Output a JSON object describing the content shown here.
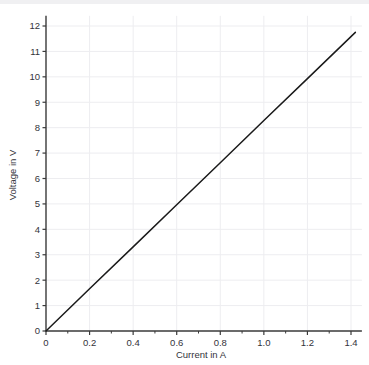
{
  "chart_data": {
    "type": "line",
    "title": "",
    "xlabel": "Current in A",
    "ylabel": "Voltage in V",
    "xlim": [
      0,
      1.45
    ],
    "ylim": [
      0,
      12.4
    ],
    "xticks": [
      0,
      0.2,
      0.4,
      0.6,
      0.8,
      1.0,
      1.2,
      1.4
    ],
    "xticklabels": [
      "0",
      "0.2",
      "0.4",
      "0.6",
      "0.8",
      "1.0",
      "1.2",
      "1.4"
    ],
    "xminor_step": 0.1,
    "yticks": [
      0,
      1,
      2,
      3,
      4,
      5,
      6,
      7,
      8,
      9,
      10,
      11,
      12
    ],
    "yticklabels": [
      "0",
      "1",
      "2",
      "3",
      "4",
      "5",
      "6",
      "7",
      "8",
      "9",
      "10",
      "11",
      "12"
    ],
    "grid": true,
    "legend": "none",
    "series": [
      {
        "name": "Voltage vs Current",
        "color": "#1a1a1a",
        "x": [
          0,
          0.2,
          0.4,
          0.6,
          0.8,
          1.0,
          1.2,
          1.42
        ],
        "y": [
          0,
          1.66,
          3.31,
          4.97,
          6.62,
          8.28,
          9.93,
          11.75
        ]
      }
    ],
    "colors": {
      "line": "#1a1a1a",
      "axis": "#3a3a3a",
      "grid": "#ededf0",
      "text": "#33333a",
      "background": "#ffffff",
      "topband": "#f0f0f2"
    }
  }
}
